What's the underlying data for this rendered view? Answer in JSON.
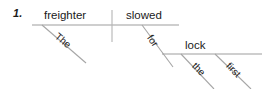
{
  "page": {
    "width": 262,
    "height": 89,
    "background": "#ffffff",
    "ink_color": "#1a1a1a",
    "line_color": "#9a9a9a",
    "divider_color": "#b0b0b0"
  },
  "exercise": {
    "number_label": "1.",
    "sentence": "The freighter slowed for the first lock",
    "diagram_type": "reed-kellogg-sentence-diagram"
  },
  "diagram": {
    "subject": {
      "label": "freighter",
      "role": "subject",
      "line": "main-baseline-left"
    },
    "verb": {
      "label": "slowed",
      "role": "predicate-verb",
      "line": "main-baseline-right"
    },
    "object_of_preposition": {
      "label": "lock",
      "role": "object-of-preposition",
      "line": "prepositional-baseline"
    },
    "modifiers": [
      {
        "label": "The",
        "role": "article-modifying-subject",
        "attached_to": "freighter",
        "line": "slant-the-subject"
      },
      {
        "label": "for",
        "role": "preposition",
        "attached_to": "slowed",
        "line": "slant-preposition"
      },
      {
        "label": "the",
        "role": "article-modifying-object",
        "attached_to": "lock",
        "line": "slant-the-object"
      },
      {
        "label": "first",
        "role": "adjective-modifying-object",
        "attached_to": "lock",
        "line": "slant-first"
      }
    ]
  },
  "lines": {
    "main_baseline": {
      "x1": 32,
      "y1": 25,
      "x2": 179,
      "y2": 25
    },
    "subject_verb_divider": {
      "x1": 112,
      "y1": 10,
      "x2": 112,
      "y2": 42
    },
    "slant_the_subject": {
      "x1": 42,
      "y1": 25,
      "x2": 86,
      "y2": 63
    },
    "slant_preposition": {
      "x1": 142,
      "y1": 25,
      "x2": 173,
      "y2": 67
    },
    "prep_baseline": {
      "x1": 162,
      "y1": 54,
      "x2": 262,
      "y2": 54
    },
    "slant_the_object": {
      "x1": 181,
      "y1": 54,
      "x2": 214,
      "y2": 88
    },
    "slant_first": {
      "x1": 215,
      "y1": 54,
      "x2": 251,
      "y2": 89
    }
  }
}
